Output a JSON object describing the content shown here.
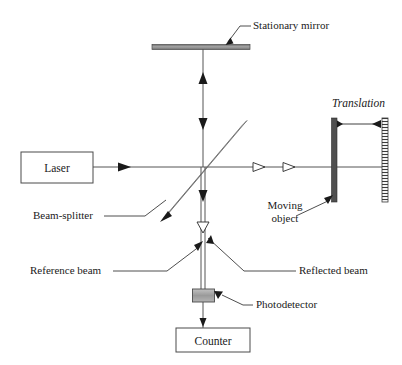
{
  "figure": {
    "type": "optical-interferometer-schematic",
    "title": "",
    "background_color": "#ffffff",
    "width": 402,
    "height": 365
  },
  "components": {
    "laser": {
      "label": "Laser",
      "shape": "rectangle",
      "x": 21,
      "y": 152,
      "w": 72,
      "h": 31
    },
    "counter": {
      "label": "Counter",
      "shape": "rectangle",
      "x": 176,
      "y": 328,
      "w": 74,
      "h": 24
    },
    "stationary_mirror": {
      "label": "Stationary mirror",
      "shape": "horizontal-bar",
      "x": 152,
      "y": 44,
      "w": 98,
      "h": 5,
      "color": "#8c8c8c"
    },
    "beam_splitter": {
      "label": "Beam-splitter",
      "shape": "diagonal-bar-45",
      "x1": 164,
      "y1": 216,
      "x2": 245,
      "y2": 122,
      "color": "#a8a8a8"
    },
    "moving_object": {
      "label": "Moving object",
      "label_line_1": "Moving",
      "label_line_2": "object",
      "shape": "vertical-bar",
      "x": 332,
      "y": 118,
      "w": 5,
      "h": 84,
      "color": "#4a4a4a"
    },
    "translation_scale": {
      "label": "Translation",
      "shape": "hatched-vertical-bar",
      "x": 382,
      "y": 118,
      "w": 6,
      "h": 84,
      "color": "#6a6a6a"
    },
    "photodetector": {
      "label": "Photodetector",
      "shape": "rectangle",
      "x": 193,
      "y": 289,
      "w": 22,
      "h": 13,
      "color": "#a0a0a0"
    }
  },
  "beams": {
    "reference_beam": {
      "label": "Reference beam"
    },
    "reflected_beam": {
      "label": "Reflected beam"
    }
  },
  "colors": {
    "stroke": "#555555",
    "text": "#1a1a1a",
    "mirror_gray": "#8c8c8c",
    "splitter_gray": "#a8a8a8",
    "detector_gray": "#a0a0a0",
    "object_dark": "#4a4a4a"
  }
}
